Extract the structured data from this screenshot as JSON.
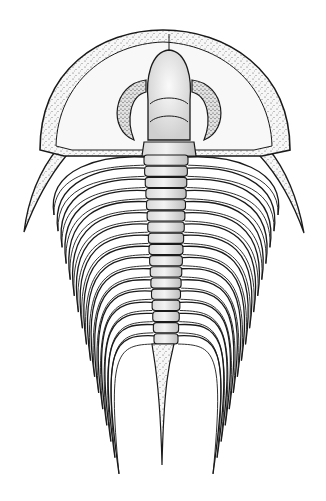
{
  "image": {
    "subject": "Trilobite illustration",
    "style": "black ink stipple drawing on white",
    "width": 326,
    "height": 501,
    "colors": {
      "background": "#ffffff",
      "ink": "#1a1a1a",
      "stipple": "#3a3a3a",
      "shell_fill": "#f6f6f6",
      "axis_fill": "#ececec"
    }
  },
  "anatomy": {
    "cephalon": {
      "top_y": 30,
      "bottom_y": 155,
      "left_x": 40,
      "right_x": 290
    },
    "glabella": {
      "tip_x": 169,
      "tip_y": 50,
      "width": 42
    },
    "genal_spine_tips": [
      {
        "x": 24,
        "y": 230
      },
      {
        "x": 304,
        "y": 231
      }
    ],
    "thorax_segments": 17,
    "axis": {
      "top_y": 155,
      "bottom_y": 345
    },
    "tail_spine_tip": {
      "x": 162,
      "y": 465
    }
  }
}
